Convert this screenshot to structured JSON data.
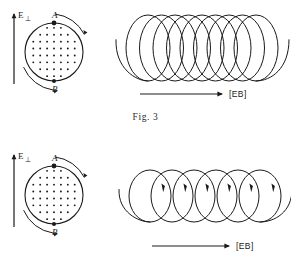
{
  "figure": {
    "caption": "Fig. 3",
    "panels": [
      {
        "id": "top",
        "name": "tight-helix-panel",
        "cross_section": {
          "field_label": "E",
          "field_subscript": "⊥",
          "point_a_label": "A",
          "point_b_label": "B",
          "dot_symbol": "·",
          "dot_rows": [
            3,
            5,
            7,
            7,
            7,
            7,
            5,
            3
          ],
          "rotation_arcs": [
            "arc-right-clockwise",
            "arc-left-clockwise"
          ]
        },
        "helix": {
          "drift_label": "[EB]",
          "turns": 9,
          "pitch_px": 13.5,
          "loop_rx": 22,
          "loop_ry": 33,
          "description": "tightly wound helix"
        }
      },
      {
        "id": "bottom",
        "name": "loose-helix-panel",
        "cross_section": {
          "field_label": "E",
          "field_subscript": "⊥",
          "point_a_label": "A",
          "point_b_label": "B",
          "dot_symbol": "·",
          "dot_rows": [
            3,
            5,
            7,
            7,
            7,
            7,
            5,
            3
          ],
          "rotation_arcs": [
            "arc-right-clockwise",
            "arc-left-clockwise"
          ]
        },
        "helix": {
          "drift_label": "[EB]",
          "turns": 6,
          "pitch_px": 22,
          "loop_rx": 21,
          "loop_ry": 26,
          "description": "loosely wound helix with arrowheads"
        }
      }
    ]
  },
  "colors": {
    "ink": "#1a1a1a",
    "background": "#ffffff"
  }
}
